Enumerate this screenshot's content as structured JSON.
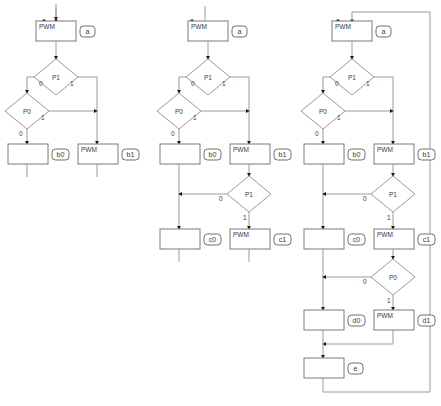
{
  "diagram": {
    "title": "",
    "type": "flowchart",
    "colors": {
      "background": "#ffffff",
      "node_stroke": "#7a7a7a",
      "diamond_stroke": "#9a9a9a",
      "edge": "#9a9a9a",
      "text": "#3a3a3a",
      "marker": "#1a1a1a"
    },
    "labels": {
      "pwm": "PWM",
      "p1": "P1",
      "p0": "P0",
      "zero": "0",
      "one": "1",
      "tag_a": "a",
      "tag_b0": "b0",
      "tag_b1": "b1",
      "tag_c0": "c0",
      "tag_c1": "c1",
      "tag_d0": "d0",
      "tag_d1": "d1",
      "tag_e": "e"
    },
    "columns": [
      {
        "name": "stage-1",
        "nodes": [
          {
            "id": "a",
            "kind": "process",
            "text": "PWM",
            "tag": "a"
          },
          {
            "id": "p1",
            "kind": "decision",
            "text": "P1",
            "branches": [
              "0",
              "1"
            ]
          },
          {
            "id": "p0",
            "kind": "decision",
            "text": "P0",
            "branches": [
              "0",
              "1"
            ]
          },
          {
            "id": "b0",
            "kind": "process",
            "text": "",
            "tag": "b0"
          },
          {
            "id": "b1",
            "kind": "process",
            "text": "PWM",
            "tag": "b1"
          }
        ]
      },
      {
        "name": "stage-2",
        "nodes": [
          {
            "id": "a",
            "kind": "process",
            "text": "PWM",
            "tag": "a"
          },
          {
            "id": "p1",
            "kind": "decision",
            "text": "P1",
            "branches": [
              "0",
              "1"
            ]
          },
          {
            "id": "p0",
            "kind": "decision",
            "text": "P0",
            "branches": [
              "0",
              "1"
            ]
          },
          {
            "id": "b0",
            "kind": "process",
            "text": "",
            "tag": "b0"
          },
          {
            "id": "b1",
            "kind": "process",
            "text": "PWM",
            "tag": "b1"
          },
          {
            "id": "p1b",
            "kind": "decision",
            "text": "P1",
            "branches": [
              "0",
              "1"
            ]
          },
          {
            "id": "c0",
            "kind": "process",
            "text": "",
            "tag": "c0"
          },
          {
            "id": "c1",
            "kind": "process",
            "text": "PWM",
            "tag": "c1"
          }
        ]
      },
      {
        "name": "stage-3",
        "nodes": [
          {
            "id": "a",
            "kind": "process",
            "text": "PWM",
            "tag": "a"
          },
          {
            "id": "p1",
            "kind": "decision",
            "text": "P1",
            "branches": [
              "0",
              "1"
            ]
          },
          {
            "id": "p0",
            "kind": "decision",
            "text": "P0",
            "branches": [
              "0",
              "1"
            ]
          },
          {
            "id": "b0",
            "kind": "process",
            "text": "",
            "tag": "b0"
          },
          {
            "id": "b1",
            "kind": "process",
            "text": "PWM",
            "tag": "b1"
          },
          {
            "id": "p1b",
            "kind": "decision",
            "text": "P1",
            "branches": [
              "0",
              "1"
            ]
          },
          {
            "id": "c0",
            "kind": "process",
            "text": "",
            "tag": "c0"
          },
          {
            "id": "c1",
            "kind": "process",
            "text": "PWM",
            "tag": "c1"
          },
          {
            "id": "p0b",
            "kind": "decision",
            "text": "P0",
            "branches": [
              "0",
              "1"
            ]
          },
          {
            "id": "d0",
            "kind": "process",
            "text": "",
            "tag": "d0"
          },
          {
            "id": "d1",
            "kind": "process",
            "text": "PWM",
            "tag": "d1"
          },
          {
            "id": "e",
            "kind": "process",
            "text": "",
            "tag": "e"
          }
        ]
      }
    ]
  }
}
